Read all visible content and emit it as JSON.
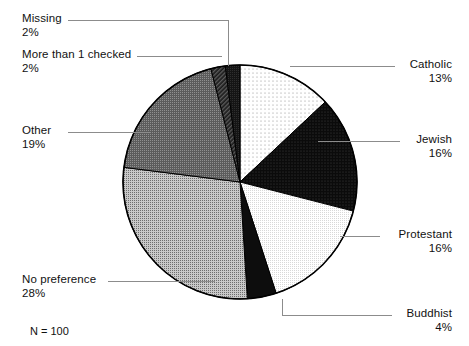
{
  "chart_data": {
    "type": "pie",
    "title": "",
    "subtitle": "",
    "xlabel": "",
    "ylabel": "",
    "legend_position": "callout-labels",
    "grid": false,
    "note": "N = 100",
    "total": 100,
    "units": "%",
    "start_angle_deg": 0,
    "direction": "clockwise",
    "categories": [
      "Catholic",
      "Jewish",
      "Protestant",
      "Buddhist",
      "No preference",
      "Other",
      "More than 1 checked",
      "Missing"
    ],
    "values": [
      13,
      16,
      16,
      4,
      28,
      19,
      2,
      2
    ],
    "slices": [
      {
        "label": "Catholic",
        "value": 13,
        "pct_text": "13%",
        "fill": "dots-sparse-light",
        "color": "#fdfdfd",
        "label_side": "right",
        "label_x": 400,
        "label_y": 58
      },
      {
        "label": "Jewish",
        "value": 16,
        "pct_text": "16%",
        "fill": "dots-dense-dark",
        "color": "#121212",
        "label_side": "right",
        "label_x": 404,
        "label_y": 126
      },
      {
        "label": "Protestant",
        "value": 16,
        "pct_text": "16%",
        "fill": "checker-very-light",
        "color": "#f0f0f0",
        "label_side": "right",
        "label_x": 384,
        "label_y": 224
      },
      {
        "label": "Buddhist",
        "value": 4,
        "pct_text": "4%",
        "fill": "solid-black",
        "color": "#0d0d0d",
        "label_side": "right",
        "label_x": 396,
        "label_y": 300
      },
      {
        "label": "No preference",
        "value": 28,
        "pct_text": "28%",
        "fill": "checker-mid-gray",
        "color": "#a8a8a8",
        "label_side": "left",
        "label_x": 22,
        "label_y": 272
      },
      {
        "label": "Other",
        "value": 19,
        "pct_text": "19%",
        "fill": "dots-dark-gray",
        "color": "#6f6f6f",
        "label_side": "left",
        "label_x": 22,
        "label_y": 124
      },
      {
        "label": "More than 1 checked",
        "value": 2,
        "pct_text": "2%",
        "fill": "hatch-diagonal-dark",
        "color": "#303030",
        "label_side": "left",
        "label_x": 22,
        "label_y": 48
      },
      {
        "label": "Missing",
        "value": 2,
        "pct_text": "2%",
        "fill": "near-black",
        "color": "#181818",
        "label_side": "left",
        "label_x": 22,
        "label_y": 12
      }
    ],
    "geometry": {
      "cx": 240,
      "cy": 182,
      "r": 117,
      "outline_color": "#000000"
    },
    "leader_line_color": "#8c8c8c"
  }
}
